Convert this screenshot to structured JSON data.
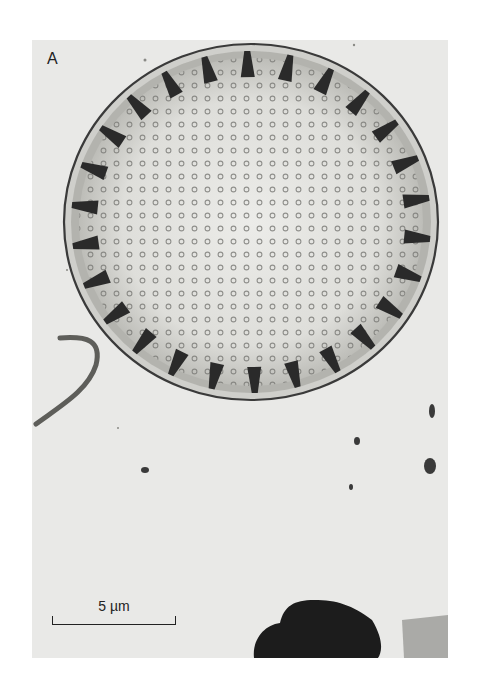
{
  "figure": {
    "panel_label": "A",
    "scale_bar": {
      "label": "5 µm"
    },
    "colors": {
      "background": "#e9e9e7",
      "valve_face": "#dcdcd8",
      "rim": "#3a3a3a",
      "spine": "#2a2a2a",
      "debris": "#1a1a1a"
    }
  }
}
